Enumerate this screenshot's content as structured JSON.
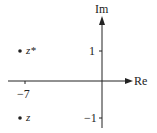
{
  "diagram": {
    "axes": {
      "x_label": "Re",
      "y_label": "Im",
      "x_ticks": [
        {
          "value": -7,
          "label": "−7"
        }
      ],
      "y_ticks": [
        {
          "value": 1,
          "label": "1"
        },
        {
          "value": -1,
          "label": "−1"
        }
      ]
    },
    "points": [
      {
        "name": "z*",
        "label": "z*",
        "re": -7,
        "im": 1
      },
      {
        "name": "z",
        "label": "z",
        "re": -7,
        "im": -1
      }
    ],
    "colors": {
      "ink": "#222222",
      "background": "#ffffff"
    }
  }
}
